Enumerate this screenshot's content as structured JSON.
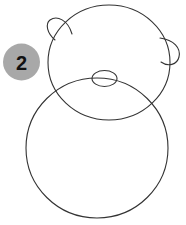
{
  "illustration": {
    "title": "Step 2 drawing guide",
    "background_color": "#ffffff",
    "stroke_color": "#333333",
    "stroke_width": 1.1,
    "shapes": [
      {
        "name": "head-circle",
        "type": "ellipse",
        "cx": 109,
        "cy": 62.5,
        "rx": 61,
        "ry": 57.5,
        "rotation": 0
      },
      {
        "name": "body-ellipse",
        "type": "ellipse",
        "cx": 97,
        "cy": 148,
        "rx": 71,
        "ry": 70,
        "rotation": 0
      },
      {
        "name": "nose-ellipse",
        "type": "ellipse",
        "cx": 104.5,
        "cy": 78.5,
        "rx": 12.5,
        "ry": 8,
        "rotation": 0
      },
      {
        "name": "left-ear",
        "type": "path",
        "d": "M 72,34 C 68,20 57,15 50,20 C 45,24 47,33 55,40"
      },
      {
        "name": "right-ear",
        "type": "path",
        "d": "M 160,38 C 174,40 181,48 179,57 C 177,65 168,67 161,62"
      }
    ]
  },
  "step_badge": {
    "label": "2",
    "fill_color": "#a8a8a8",
    "text_color": "#111111",
    "cx": 21.5,
    "cy": 62,
    "r": 18.5
  }
}
